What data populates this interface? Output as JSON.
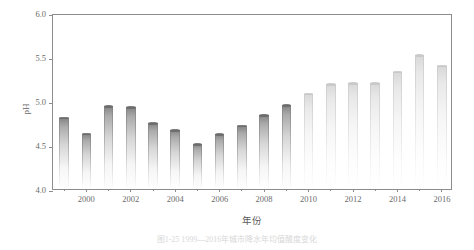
{
  "chart_data": {
    "type": "bar",
    "title": "",
    "xlabel": "年份",
    "ylabel": "pH",
    "ylim": [
      4.0,
      6.0
    ],
    "yticks": [
      "4.0",
      "4.5",
      "5.0",
      "5.5",
      "6.0"
    ],
    "ytick_values": [
      4.0,
      4.5,
      5.0,
      5.5,
      6.0
    ],
    "xticks": [
      "2000",
      "2002",
      "2004",
      "2006",
      "2008",
      "2010",
      "2012",
      "2014",
      "2016"
    ],
    "xtick_values": [
      2000,
      2002,
      2004,
      2006,
      2008,
      2010,
      2012,
      2014,
      2016
    ],
    "grid": false,
    "legend": "none",
    "categories": [
      1999,
      2000,
      2001,
      2002,
      2003,
      2004,
      2005,
      2006,
      2007,
      2008,
      2009,
      2010,
      2011,
      2012,
      2013,
      2014,
      2015,
      2016
    ],
    "values": [
      4.81,
      4.63,
      4.94,
      4.93,
      4.75,
      4.67,
      4.51,
      4.62,
      4.72,
      4.84,
      4.95,
      5.08,
      5.19,
      5.2,
      5.2,
      5.33,
      5.52,
      5.4
    ],
    "bars": [
      {
        "year": "1999",
        "value": 4.81,
        "style": "dark"
      },
      {
        "year": "2000",
        "value": 4.63,
        "style": "dark"
      },
      {
        "year": "2001",
        "value": 4.94,
        "style": "dark"
      },
      {
        "year": "2002",
        "value": 4.93,
        "style": "dark"
      },
      {
        "year": "2003",
        "value": 4.75,
        "style": "dark"
      },
      {
        "year": "2004",
        "value": 4.67,
        "style": "dark"
      },
      {
        "year": "2005",
        "value": 4.51,
        "style": "dark"
      },
      {
        "year": "2006",
        "value": 4.62,
        "style": "dark"
      },
      {
        "year": "2007",
        "value": 4.72,
        "style": "dark"
      },
      {
        "year": "2008",
        "value": 4.84,
        "style": "dark"
      },
      {
        "year": "2009",
        "value": 4.95,
        "style": "dark"
      },
      {
        "year": "2010",
        "value": 5.08,
        "style": "light"
      },
      {
        "year": "2011",
        "value": 5.19,
        "style": "light"
      },
      {
        "year": "2012",
        "value": 5.2,
        "style": "light"
      },
      {
        "year": "2013",
        "value": 5.2,
        "style": "light"
      },
      {
        "year": "2014",
        "value": 5.33,
        "style": "light"
      },
      {
        "year": "2015",
        "value": 5.52,
        "style": "light"
      },
      {
        "year": "2016",
        "value": 5.4,
        "style": "light"
      }
    ],
    "bar_color_dark": "#787878",
    "bar_color_light": "#cdcdcd",
    "axis_color": "#8c8c8c",
    "text_color": "#6b6b6b"
  },
  "caption": {
    "text": "图1-25  1999—2016年城市降水年均值酸度变化"
  }
}
